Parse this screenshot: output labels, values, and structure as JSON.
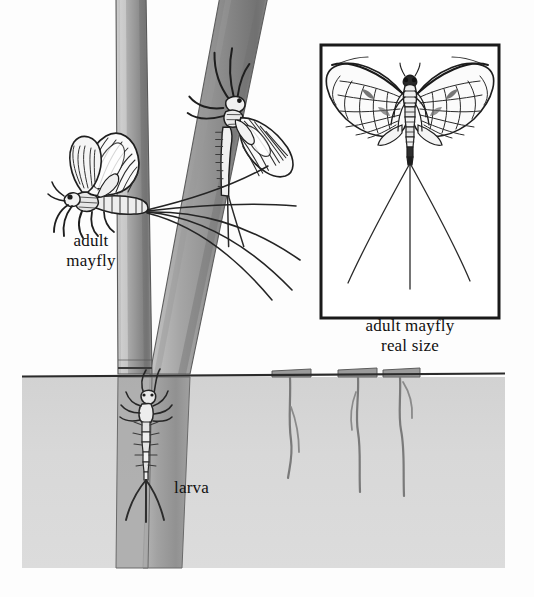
{
  "figure": {
    "subject": "mayfly",
    "width": 534,
    "height": 597,
    "background_color": "#fdfdfd",
    "style": "pen-and-ink scientific illustration, grayscale"
  },
  "labels": {
    "adult_mayfly": "adult\nmayfly",
    "adult_mayfly_real_size": "adult mayfly\nreal size",
    "larva": "larva"
  },
  "inset_box": {
    "x": 321,
    "y": 45,
    "width": 178,
    "height": 273,
    "border_color": "#1a1a1a",
    "border_width": 3,
    "fill": "#ffffff",
    "contents": "adult mayfly shown at real size, wings spread, three long tails"
  },
  "water": {
    "surface_line_y": 376,
    "left": 22,
    "right": 505,
    "bottom": 568,
    "fill_color": "#d6d6d6",
    "surface_line_color": "#2b2b2b"
  },
  "plants": {
    "stem_color_light": "#b9b9b9",
    "stem_color_dark": "#7d7d7d",
    "stems": [
      {
        "name": "vertical-stem",
        "top_x": 116,
        "top_width": 30,
        "base_x": 122
      },
      {
        "name": "diagonal-stem",
        "top_x": 220,
        "top_width": 48,
        "base_x": 148
      }
    ],
    "cut_stems": [
      {
        "name": "cut-stem-1",
        "x": 272,
        "width": 38
      },
      {
        "name": "cut-stem-2",
        "x": 338,
        "width": 38
      },
      {
        "name": "cut-stem-3",
        "x": 383,
        "width": 36
      }
    ]
  },
  "insects": {
    "adult_left": {
      "name": "adult-mayfly-left",
      "x": 55,
      "y": 130,
      "facing": "left",
      "description": "adult mayfly clinging to vertical stem, wings raised, long fanned tails"
    },
    "adult_upper": {
      "name": "adult-mayfly-upper",
      "x": 205,
      "y": 45,
      "facing": "up-right",
      "description": "adult mayfly climbing diagonal stem, wings folded back, tails trailing down"
    },
    "adult_inset": {
      "name": "adult-mayfly-inset",
      "description": "adult mayfly real size with spread wings and three tails"
    },
    "larva": {
      "name": "mayfly-larva",
      "x": 130,
      "y": 390,
      "description": "mayfly larva (nymph) submerged, clinging to stem below waterline"
    }
  },
  "colors": {
    "ink": "#1a1a1a",
    "mid_gray": "#8a8a8a",
    "light_gray": "#d6d6d6",
    "paper": "#fdfdfd"
  }
}
